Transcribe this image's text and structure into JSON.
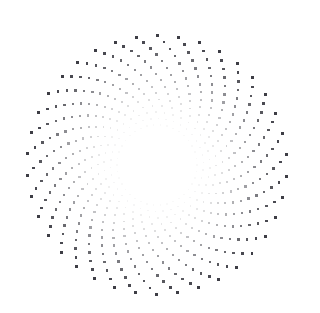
{
  "page": {
    "background_color": "#ffffff",
    "width": 298,
    "height": 313
  },
  "figure": {
    "name": "spiral-dot-pattern"
  },
  "chart_data": {
    "type": "scatter",
    "title": "",
    "subtitle": "",
    "xlabel": "",
    "ylabel": "",
    "grid": false,
    "legend": false,
    "axes_visible": false,
    "coordinate_system": "polar",
    "center": {
      "x": 157,
      "y": 165
    },
    "radius_min": 40,
    "radius_max": 132,
    "ring_count": 15,
    "points_per_ring": 38,
    "spiral_twist_deg_per_ring": -12.5,
    "ring_radial_step": 6.4,
    "dot_shape": "square",
    "dot_color": "#33333b",
    "dot_size_outer": 2.9,
    "dot_size_inner": 1.5,
    "opacity_outer": 0.95,
    "opacity_inner": 0.03,
    "opacity_falloff_power": 2.6,
    "angular_jitter_deg": 0.0,
    "xlim": [
      0,
      298
    ],
    "ylim": [
      0,
      313
    ],
    "rings": [
      {
        "index": 0,
        "radius": 40,
        "rotation_deg": 0.0,
        "opacity": 0.03,
        "dot_size": 1.5
      },
      {
        "index": 1,
        "radius": 46.4,
        "rotation_deg": -12.5,
        "opacity": 0.048,
        "dot_size": 1.59
      },
      {
        "index": 2,
        "radius": 52.8,
        "rotation_deg": -25.0,
        "opacity": 0.075,
        "dot_size": 1.69
      },
      {
        "index": 3,
        "radius": 59.2,
        "rotation_deg": -37.5,
        "opacity": 0.112,
        "dot_size": 1.78
      },
      {
        "index": 4,
        "radius": 65.6,
        "rotation_deg": -50.0,
        "opacity": 0.16,
        "dot_size": 1.88
      },
      {
        "index": 5,
        "radius": 72.0,
        "rotation_deg": -62.5,
        "opacity": 0.222,
        "dot_size": 1.97
      },
      {
        "index": 6,
        "radius": 78.4,
        "rotation_deg": -75.0,
        "opacity": 0.297,
        "dot_size": 2.07
      },
      {
        "index": 7,
        "radius": 84.8,
        "rotation_deg": -87.5,
        "opacity": 0.388,
        "dot_size": 2.16
      },
      {
        "index": 8,
        "radius": 91.2,
        "rotation_deg": -100.0,
        "opacity": 0.466,
        "dot_size": 2.26
      },
      {
        "index": 9,
        "radius": 97.6,
        "rotation_deg": -112.5,
        "opacity": 0.556,
        "dot_size": 2.35
      },
      {
        "index": 10,
        "radius": 104.0,
        "rotation_deg": -125.0,
        "opacity": 0.646,
        "dot_size": 2.45
      },
      {
        "index": 11,
        "radius": 110.4,
        "rotation_deg": -137.5,
        "opacity": 0.736,
        "dot_size": 2.54
      },
      {
        "index": 12,
        "radius": 116.8,
        "rotation_deg": -150.0,
        "opacity": 0.82,
        "dot_size": 2.64
      },
      {
        "index": 13,
        "radius": 123.2,
        "rotation_deg": -162.5,
        "opacity": 0.89,
        "dot_size": 2.73
      },
      {
        "index": 14,
        "radius": 129.6,
        "rotation_deg": -175.0,
        "opacity": 0.95,
        "dot_size": 2.9
      }
    ]
  }
}
